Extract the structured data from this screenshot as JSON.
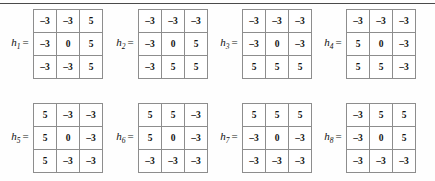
{
  "figure": {
    "title": "",
    "top_rule": true,
    "background_color": "#fefefe",
    "grid_line_color": "#8d8d8d",
    "text_color": "#141414"
  },
  "kernels": [
    {
      "label": "h",
      "subscript": "1",
      "equals": "=",
      "rows": [
        [
          "–3",
          "–3",
          "5"
        ],
        [
          "–3",
          "0",
          "5"
        ],
        [
          "–3",
          "–3",
          "5"
        ]
      ]
    },
    {
      "label": "h",
      "subscript": "2",
      "equals": "=",
      "rows": [
        [
          "–3",
          "–3",
          "–3"
        ],
        [
          "–3",
          "0",
          "5"
        ],
        [
          "–3",
          "5",
          "5"
        ]
      ]
    },
    {
      "label": "h",
      "subscript": "3",
      "equals": "=",
      "rows": [
        [
          "–3",
          "–3",
          "–3"
        ],
        [
          "–3",
          "0",
          "–3"
        ],
        [
          "5",
          "5",
          "5"
        ]
      ]
    },
    {
      "label": "h",
      "subscript": "4",
      "equals": "=",
      "rows": [
        [
          "–3",
          "–3",
          "–3"
        ],
        [
          "5",
          "0",
          "–3"
        ],
        [
          "5",
          "5",
          "–3"
        ]
      ]
    },
    {
      "label": "h",
      "subscript": "5",
      "equals": "=",
      "rows": [
        [
          "5",
          "–3",
          "–3"
        ],
        [
          "5",
          "0",
          "–3"
        ],
        [
          "5",
          "–3",
          "–3"
        ]
      ]
    },
    {
      "label": "h",
      "subscript": "6",
      "equals": "=",
      "rows": [
        [
          "5",
          "5",
          "–3"
        ],
        [
          "5",
          "0",
          "–3"
        ],
        [
          "–3",
          "–3",
          "–3"
        ]
      ]
    },
    {
      "label": "h",
      "subscript": "7",
      "equals": "=",
      "rows": [
        [
          "5",
          "5",
          "5"
        ],
        [
          "–3",
          "0",
          "–3"
        ],
        [
          "–3",
          "–3",
          "–3"
        ]
      ]
    },
    {
      "label": "h",
      "subscript": "8",
      "equals": "=",
      "rows": [
        [
          "–3",
          "5",
          "5"
        ],
        [
          "–3",
          "0",
          "5"
        ],
        [
          "–3",
          "–3",
          "–3"
        ]
      ]
    }
  ]
}
